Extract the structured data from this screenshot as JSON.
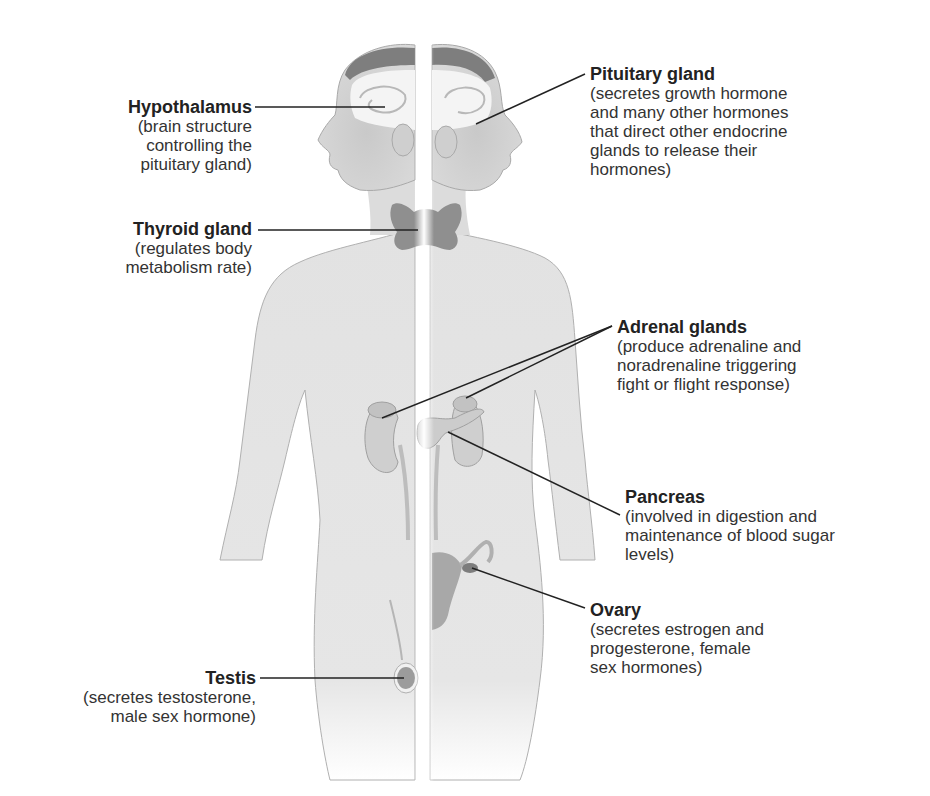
{
  "figure": {
    "colors": {
      "skin": "#e4e4e4",
      "skin_shade": "#c8c8c8",
      "hair": "#7a7a7a",
      "gland": "#9a9a9a",
      "gland_dark": "#7d7d7d",
      "leader_line": "#222222",
      "text": "#333333",
      "background": "#ffffff"
    }
  },
  "labels": {
    "hypothalamus": {
      "title": "Hypothalamus",
      "desc": "(brain structure\ncontrolling the\npituitary gland)"
    },
    "pituitary": {
      "title": "Pituitary gland",
      "desc": "(secretes growth hormone\nand many other hormones\nthat direct other endocrine\nglands to release their\nhormones)"
    },
    "thyroid": {
      "title": "Thyroid gland",
      "desc": "(regulates body\nmetabolism rate)"
    },
    "adrenal": {
      "title": "Adrenal glands",
      "desc": "(produce adrenaline and\nnoradrenaline triggering\nfight or flight response)"
    },
    "pancreas": {
      "title": "Pancreas",
      "desc": "(involved in digestion and\nmaintenance of blood sugar\nlevels)"
    },
    "ovary": {
      "title": "Ovary",
      "desc": "(secretes estrogen and\nprogesterone, female\nsex hormones)"
    },
    "testis": {
      "title": "Testis",
      "desc": "(secretes testosterone,\nmale sex hormone)"
    }
  }
}
